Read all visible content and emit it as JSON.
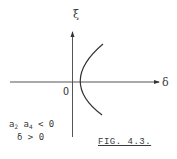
{
  "figure": {
    "caption": "FIG. 4.3.",
    "y_axis_label": "ξ",
    "x_axis_label": "δ",
    "origin_label": "O",
    "conditions": {
      "line1": {
        "a": "a",
        "sub1": "2",
        "b": " a",
        "sub2": "4",
        "rest": " < 0"
      },
      "line2": "δ > 0"
    },
    "curve": "parabola opening right, vertex at origin",
    "colors": {
      "ink": "#333333",
      "background": "#ffffff"
    }
  }
}
